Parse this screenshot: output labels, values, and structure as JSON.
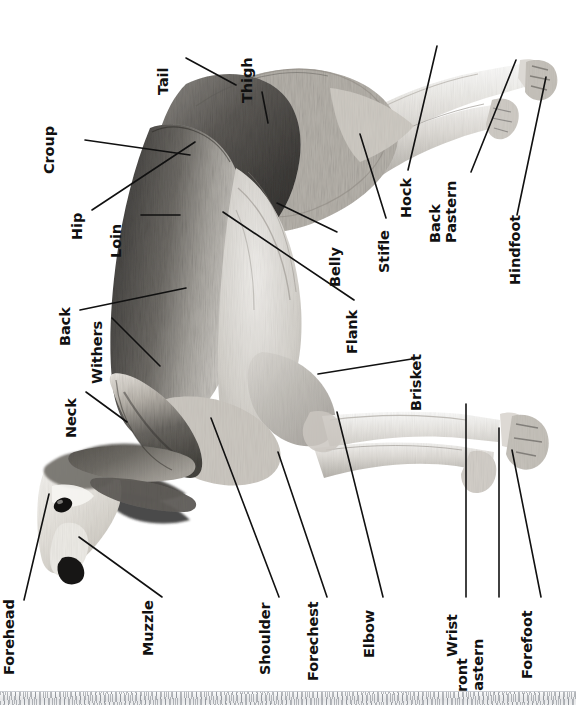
{
  "diagram": {
    "orientation": "rotated-90-counterclockwise",
    "background_color": "#ffffff",
    "label_color": "#111111",
    "leader_line_color": "#111111",
    "bottom_strip_color": "#e6e7e9"
  },
  "labels": [
    {
      "id": "tail",
      "text": "Tail"
    },
    {
      "id": "thigh",
      "text": "Thigh"
    },
    {
      "id": "croup",
      "text": "Croup"
    },
    {
      "id": "hip",
      "text": "Hip"
    },
    {
      "id": "loin",
      "text": "Loin"
    },
    {
      "id": "hock",
      "text": "Hock"
    },
    {
      "id": "back_pastern",
      "text": "Back\nPastern"
    },
    {
      "id": "stifle",
      "text": "Stifle"
    },
    {
      "id": "belly",
      "text": "Belly"
    },
    {
      "id": "hindfoot",
      "text": "Hindfoot"
    },
    {
      "id": "flank",
      "text": "Flank"
    },
    {
      "id": "back",
      "text": "Back"
    },
    {
      "id": "withers",
      "text": "Withers"
    },
    {
      "id": "brisket",
      "text": "Brisket"
    },
    {
      "id": "neck",
      "text": "Neck"
    },
    {
      "id": "forehead",
      "text": "Forehead"
    },
    {
      "id": "muzzle",
      "text": "Muzzle"
    },
    {
      "id": "shoulder",
      "text": "Shoulder"
    },
    {
      "id": "forechest",
      "text": "Forechest"
    },
    {
      "id": "elbow",
      "text": "Elbow"
    },
    {
      "id": "wrist",
      "text": "Wrist"
    },
    {
      "id": "front_pastern",
      "text": "Front\nPastern"
    },
    {
      "id": "forefoot",
      "text": "Forefoot"
    }
  ]
}
